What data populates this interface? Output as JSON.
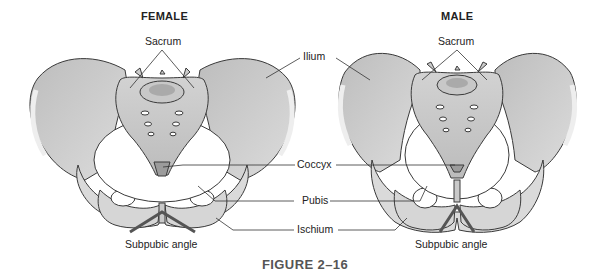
{
  "figure": {
    "caption": "FIGURE 2–16",
    "panels": [
      {
        "title": "FEMALE",
        "sacrum_label": "Sacrum",
        "angle_label": "Subpubic angle"
      },
      {
        "title": "MALE",
        "sacrum_label": "Sacrum",
        "angle_label": "Subpubic angle"
      }
    ],
    "center_labels": {
      "ilium": "Ilium",
      "coccyx": "Coccyx",
      "pubis": "Pubis",
      "ischium": "Ischium"
    }
  },
  "colors": {
    "bone_fill": "#d9d9d9",
    "bone_dark": "#a8a8a8",
    "outline": "#3a3a3a",
    "caption": "#555555"
  }
}
